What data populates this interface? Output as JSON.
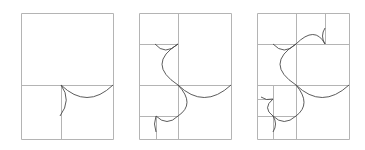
{
  "figure": {
    "colors": {
      "grid": "#b4b4b4",
      "arc": "#4a4a4a",
      "background": "#ffffff"
    },
    "panels": [
      {
        "id": "stage-1",
        "lines": [
          [
            21,
            13,
            113,
            13
          ],
          [
            113,
            13,
            113,
            139
          ],
          [
            113,
            139,
            21,
            139
          ],
          [
            21,
            139,
            21,
            13
          ],
          [
            21,
            85,
            113,
            85
          ],
          [
            61,
            85,
            61,
            139
          ]
        ],
        "arcs": [
          "M61,85 Q87,110 113,85",
          "M61,85 Q72,100 60,116"
        ]
      },
      {
        "id": "stage-2",
        "lines": [
          [
            139,
            13,
            231,
            13
          ],
          [
            231,
            13,
            231,
            139
          ],
          [
            231,
            139,
            139,
            139
          ],
          [
            139,
            139,
            139,
            13
          ],
          [
            178,
            13,
            178,
            139
          ],
          [
            139,
            44,
            178,
            44
          ],
          [
            139,
            85,
            231,
            85
          ],
          [
            139,
            116,
            178,
            116
          ],
          [
            156,
            116,
            156,
            139
          ]
        ],
        "arcs": [
          "M178,85 Q204,110 231,85",
          "M178,85 Q146,64 178,44",
          "M178,44 Q165,56 155,44",
          "M178,85 Q196,104 178,116",
          "M178,116 Q167,127 156,116",
          "M156,116 Q153,124 156,132"
        ]
      },
      {
        "id": "stage-3",
        "lines": [
          [
            257,
            13,
            349,
            13
          ],
          [
            349,
            13,
            349,
            139
          ],
          [
            349,
            139,
            257,
            139
          ],
          [
            257,
            139,
            257,
            13
          ],
          [
            296,
            13,
            296,
            139
          ],
          [
            257,
            44,
            349,
            44
          ],
          [
            325,
            13,
            325,
            44
          ],
          [
            257,
            85,
            349,
            85
          ],
          [
            273,
            85,
            273,
            139
          ],
          [
            257,
            99,
            273,
            99
          ],
          [
            257,
            116,
            296,
            116
          ]
        ],
        "arcs": [
          "M296,85 Q322,110 349,85",
          "M296,85 Q264,64 296,44",
          "M296,44 Q315,25 325,44",
          "M325,44 Q320,36 325,28",
          "M296,44 Q284,56 273,44",
          "M296,85 Q312,104 296,116",
          "M296,116 Q284,127 273,116",
          "M273,116 Q262,108 273,99",
          "M273,99 Q266,101 261,97",
          "M273,116 Q278,124 273,132"
        ]
      }
    ]
  }
}
